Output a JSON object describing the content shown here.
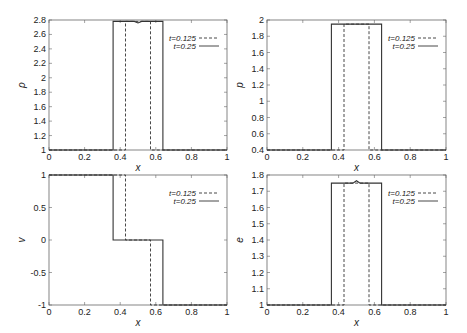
{
  "chart_data": [
    {
      "type": "line",
      "id": "rho",
      "xlabel": "x",
      "ylabel": "ρ",
      "xlim": [
        0,
        1
      ],
      "ylim": [
        1,
        2.8
      ],
      "xticks": [
        "0",
        "0.2",
        "0.4",
        "0.6",
        "0.8",
        "1"
      ],
      "yticks": [
        "1",
        "1.2",
        "1.4",
        "1.6",
        "1.8",
        "2",
        "2.2",
        "2.4",
        "2.6",
        "2.8"
      ],
      "ytick_values": [
        1,
        1.2,
        1.4,
        1.6,
        1.8,
        2,
        2.2,
        2.4,
        2.6,
        2.8
      ],
      "legend": [
        "t=0.125",
        "t=0.25"
      ],
      "series": [
        {
          "name": "t=0.125",
          "style": "dashed",
          "x": [
            0,
            0.43,
            0.43,
            0.57,
            0.57,
            1
          ],
          "y": [
            1,
            1,
            2.78,
            2.78,
            1,
            1
          ]
        },
        {
          "name": "t=0.25",
          "style": "solid",
          "x": [
            0,
            0.36,
            0.36,
            0.48,
            0.5,
            0.52,
            0.64,
            0.64,
            1
          ],
          "y": [
            1,
            1,
            2.78,
            2.78,
            2.76,
            2.78,
            2.78,
            1,
            1
          ]
        }
      ]
    },
    {
      "type": "line",
      "id": "p",
      "xlabel": "x",
      "ylabel": "p",
      "xlim": [
        0,
        1
      ],
      "ylim": [
        0.4,
        2
      ],
      "xticks": [
        "0",
        "0.2",
        "0.4",
        "0.6",
        "0.8",
        "1"
      ],
      "yticks": [
        "0.4",
        "0.6",
        "0.8",
        "1",
        "1.2",
        "1.4",
        "1.6",
        "1.8",
        "2"
      ],
      "ytick_values": [
        0.4,
        0.6,
        0.8,
        1,
        1.2,
        1.4,
        1.6,
        1.8,
        2
      ],
      "legend": [
        "t=0.125",
        "t=0.25"
      ],
      "series": [
        {
          "name": "t=0.125",
          "style": "dashed",
          "x": [
            0,
            0.43,
            0.43,
            0.57,
            0.57,
            1
          ],
          "y": [
            0.4,
            0.4,
            1.95,
            1.95,
            0.4,
            0.4
          ]
        },
        {
          "name": "t=0.25",
          "style": "solid",
          "x": [
            0,
            0.36,
            0.36,
            0.64,
            0.64,
            1
          ],
          "y": [
            0.4,
            0.4,
            1.95,
            1.95,
            0.4,
            0.4
          ]
        }
      ]
    },
    {
      "type": "line",
      "id": "v",
      "xlabel": "x",
      "ylabel": "v",
      "xlim": [
        0,
        1
      ],
      "ylim": [
        -1,
        1
      ],
      "xticks": [
        "0",
        "0.2",
        "0.4",
        "0.6",
        "0.8",
        "1"
      ],
      "yticks": [
        "-1",
        "-0.5",
        "0",
        "0.5",
        "1"
      ],
      "ytick_values": [
        -1,
        -0.5,
        0,
        0.5,
        1
      ],
      "legend": [
        "t=0.125",
        "t=0.25"
      ],
      "series": [
        {
          "name": "t=0.125",
          "style": "dashed",
          "x": [
            0,
            0.43,
            0.43,
            0.57,
            0.57,
            1
          ],
          "y": [
            1,
            1,
            0,
            0,
            -1,
            -1
          ]
        },
        {
          "name": "t=0.25",
          "style": "solid",
          "x": [
            0,
            0.36,
            0.36,
            0.64,
            0.64,
            1
          ],
          "y": [
            1,
            1,
            0,
            0,
            -1,
            -1
          ]
        }
      ]
    },
    {
      "type": "line",
      "id": "e",
      "xlabel": "x",
      "ylabel": "e",
      "xlim": [
        0,
        1
      ],
      "ylim": [
        1,
        1.8
      ],
      "xticks": [
        "0",
        "0.2",
        "0.4",
        "0.6",
        "0.8",
        "1"
      ],
      "yticks": [
        "1",
        "1.1",
        "1.2",
        "1.3",
        "1.4",
        "1.5",
        "1.6",
        "1.7",
        "1.8"
      ],
      "ytick_values": [
        1,
        1.1,
        1.2,
        1.3,
        1.4,
        1.5,
        1.6,
        1.7,
        1.8
      ],
      "legend": [
        "t=0.125",
        "t=0.25"
      ],
      "series": [
        {
          "name": "t=0.125",
          "style": "dashed",
          "x": [
            0,
            0.43,
            0.43,
            0.57,
            0.57,
            1
          ],
          "y": [
            1,
            1,
            1.75,
            1.75,
            1,
            1
          ]
        },
        {
          "name": "t=0.25",
          "style": "solid",
          "x": [
            0,
            0.36,
            0.36,
            0.48,
            0.5,
            0.52,
            0.64,
            0.64,
            1
          ],
          "y": [
            1,
            1,
            1.75,
            1.75,
            1.765,
            1.75,
            1.75,
            1,
            1
          ]
        }
      ]
    }
  ],
  "layout": {
    "panels": [
      {
        "left": 49,
        "top": 20,
        "width": 178,
        "height": 130
      },
      {
        "left": 267,
        "top": 20,
        "width": 179,
        "height": 130
      },
      {
        "left": 49,
        "top": 175,
        "width": 178,
        "height": 130
      },
      {
        "left": 267,
        "top": 175,
        "width": 179,
        "height": 130
      }
    ],
    "line_color": "#333333",
    "frame_color": "#666666"
  }
}
